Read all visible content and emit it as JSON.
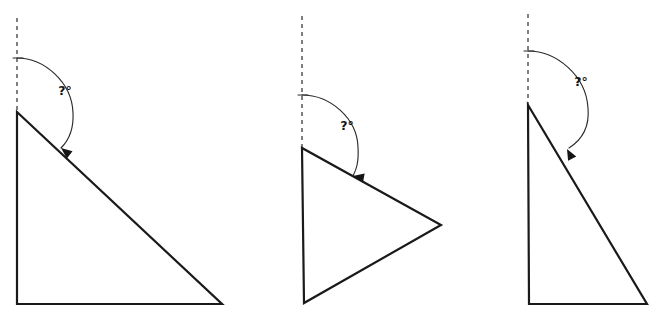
{
  "canvas": {
    "width": 658,
    "height": 314,
    "background": "#ffffff"
  },
  "style": {
    "outline_color": "#1a1a1a",
    "dashed_color": "#4a4a4a",
    "arc_color": "#2b2b2b",
    "label_color": "#141414",
    "outline_width": 2.2,
    "dash_pattern": "4 4"
  },
  "figures": [
    {
      "id": "figure-1",
      "name": "right-triangle-left",
      "label": "?°",
      "label_pos": {
        "x": 65,
        "y": 95
      },
      "vertices": [
        {
          "x": 17,
          "y": 112
        },
        {
          "x": 17,
          "y": 304
        },
        {
          "x": 222,
          "y": 304
        }
      ],
      "polygon_points": "17,112 17,304 222,304",
      "dashed_ray": {
        "x1": 17,
        "y1": 18,
        "x2": 17,
        "y2": 112
      },
      "arc_path": "M 17 58 C 44 58, 72 82, 73 113 C 74 131, 68 141, 61 148",
      "arc_tick": {
        "x1": 13,
        "y1": 58,
        "x2": 23,
        "y2": 58
      },
      "arrow": {
        "x": 61,
        "y": 148,
        "angle": 128
      }
    },
    {
      "id": "figure-2",
      "name": "isosceles-triangle-middle",
      "label": "?°",
      "label_pos": {
        "x": 347,
        "y": 130
      },
      "vertices": [
        {
          "x": 302,
          "y": 148
        },
        {
          "x": 304,
          "y": 303
        },
        {
          "x": 441,
          "y": 225
        }
      ],
      "polygon_points": "302,148 304,303 441,225",
      "dashed_ray": {
        "x1": 302,
        "y1": 16,
        "x2": 302,
        "y2": 148
      },
      "arc_path": "M 302 95 C 330 95, 357 118, 358 147 C 359 163, 356 170, 353 176",
      "arc_tick": {
        "x1": 298,
        "y1": 95,
        "x2": 308,
        "y2": 95
      },
      "arrow": {
        "x": 353,
        "y": 176,
        "angle": 100
      }
    },
    {
      "id": "figure-3",
      "name": "right-triangle-right",
      "label": "?°",
      "label_pos": {
        "x": 581,
        "y": 86
      },
      "vertices": [
        {
          "x": 528,
          "y": 105
        },
        {
          "x": 529,
          "y": 304
        },
        {
          "x": 647,
          "y": 304
        }
      ],
      "polygon_points": "528,105 529,304 647,304",
      "dashed_ray": {
        "x1": 528,
        "y1": 14,
        "x2": 528,
        "y2": 105
      },
      "arc_path": "M 528 51 C 556 51, 586 75, 588 108 C 590 130, 580 141, 569 148",
      "arc_tick": {
        "x1": 524,
        "y1": 51,
        "x2": 534,
        "y2": 51
      },
      "arrow": {
        "x": 567,
        "y": 149,
        "angle": 152
      }
    }
  ]
}
